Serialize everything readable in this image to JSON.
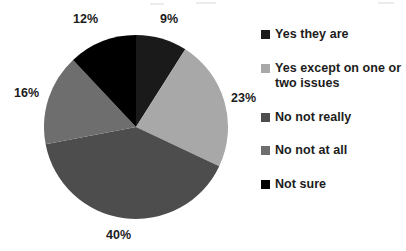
{
  "chart_data": {
    "type": "pie",
    "title": "",
    "subtitle": "",
    "xlabel": "",
    "ylabel": "",
    "grid": false,
    "legend_position": "right",
    "start_angle_deg": 0,
    "direction": "clockwise",
    "units": "percent",
    "categories": [
      "Yes they are",
      "Yes except on one or two issues",
      "No not really",
      "No not at all",
      "Not sure"
    ],
    "values": [
      9,
      23,
      40,
      16,
      12
    ],
    "value_labels": [
      "9%",
      "23%",
      "40%",
      "16%",
      "12%"
    ],
    "colors": [
      "#1a1a1a",
      "#a8a8a8",
      "#4d4d4d",
      "#6e6e6e",
      "#000000"
    ],
    "slices": [
      {
        "label": "Yes they are",
        "value": 9,
        "display": "9%",
        "color": "#1a1a1a"
      },
      {
        "label": "Yes except on one or two issues",
        "value": 23,
        "display": "23%",
        "color": "#a8a8a8"
      },
      {
        "label": "No not really",
        "value": 40,
        "display": "40%",
        "color": "#4d4d4d"
      },
      {
        "label": "No not at all",
        "value": 16,
        "display": "16%",
        "color": "#6e6e6e"
      },
      {
        "label": "Not sure",
        "value": 12,
        "display": "12%",
        "color": "#000000"
      }
    ]
  },
  "legend": {
    "items": [
      {
        "label": "Yes they are",
        "color": "#1a1a1a"
      },
      {
        "label": "Yes except on one or two issues",
        "color": "#a8a8a8"
      },
      {
        "label": "No not really",
        "color": "#4d4d4d"
      },
      {
        "label": "No not at all",
        "color": "#6e6e6e"
      },
      {
        "label": "Not sure",
        "color": "#000000"
      }
    ]
  },
  "labels": {
    "pct_not_sure": "12%",
    "pct_yes_they_are": "9%",
    "pct_yes_except": "23%",
    "pct_no_not_at_all": "16%",
    "pct_no_not_really": "40%"
  }
}
